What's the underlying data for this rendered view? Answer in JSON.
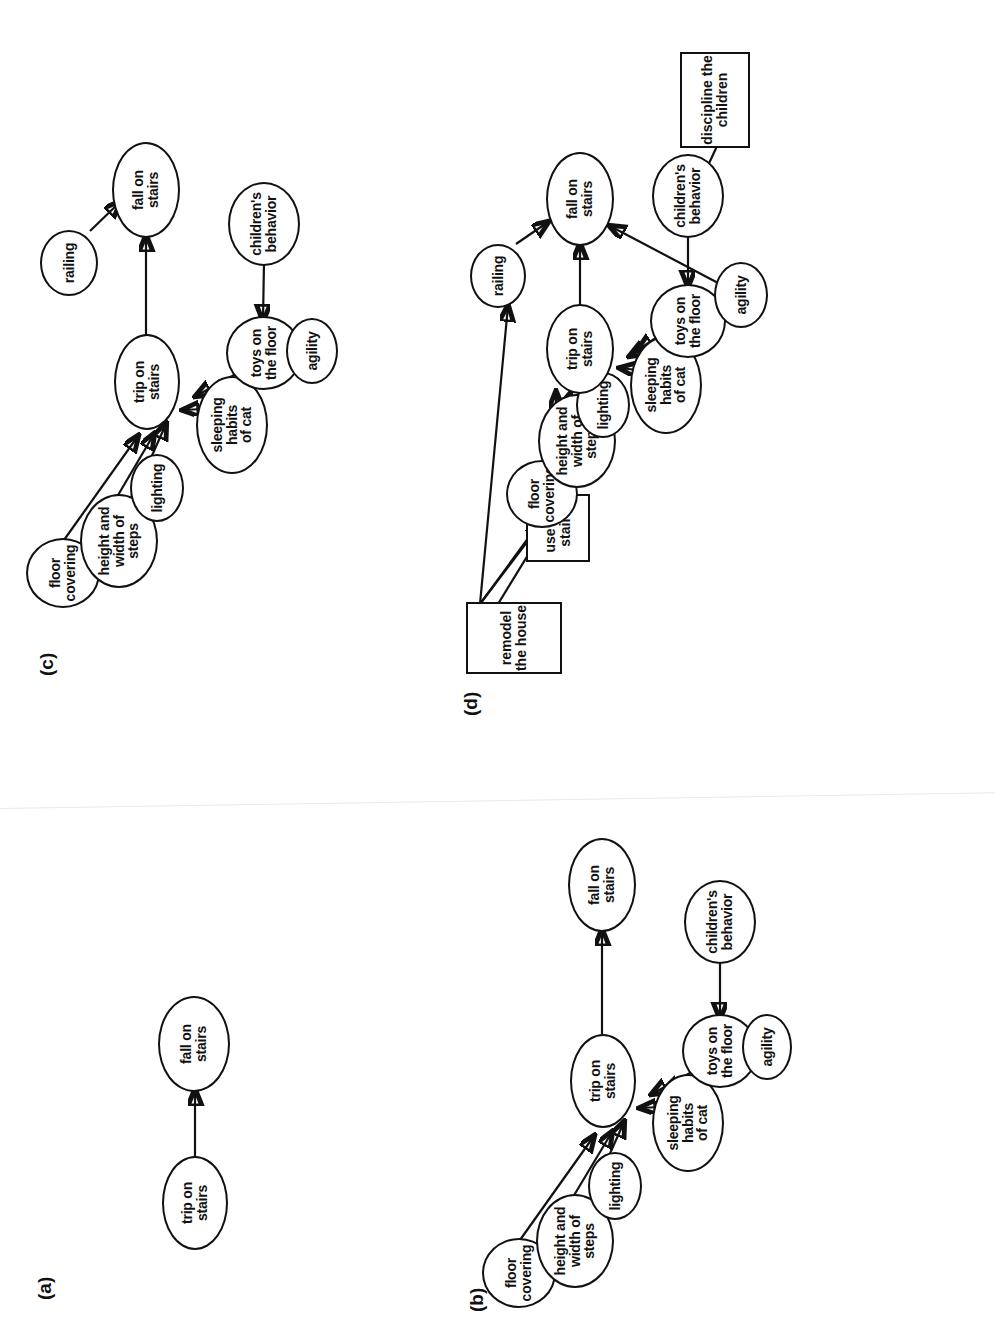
{
  "figure": {
    "orientation": "rotated-90-ccw",
    "background": "#ffffff",
    "ink": "#111111"
  },
  "panels": [
    {
      "id": "a",
      "label": "(a)",
      "nodes": [
        {
          "id": "trip",
          "label": "trip on\nstairs",
          "shape": "ellipse"
        },
        {
          "id": "fall",
          "label": "fall on\nstairs",
          "shape": "ellipse"
        }
      ],
      "edges": [
        {
          "from": "trip",
          "to": "fall"
        }
      ]
    },
    {
      "id": "b",
      "label": "(b)",
      "nodes": [
        {
          "id": "floor",
          "label": "floor\ncovering",
          "shape": "ellipse"
        },
        {
          "id": "height",
          "label": "height and\nwidth of steps",
          "shape": "ellipse"
        },
        {
          "id": "lighting",
          "label": "lighting",
          "shape": "ellipse"
        },
        {
          "id": "cat",
          "label": "sleeping habits\nof cat",
          "shape": "ellipse"
        },
        {
          "id": "toys",
          "label": "toys on\nthe floor",
          "shape": "ellipse"
        },
        {
          "id": "agility",
          "label": "agility",
          "shape": "ellipse"
        },
        {
          "id": "children",
          "label": "children's\nbehavior",
          "shape": "ellipse"
        },
        {
          "id": "trip",
          "label": "trip on\nstairs",
          "shape": "ellipse"
        },
        {
          "id": "fall",
          "label": "fall on\nstairs",
          "shape": "ellipse"
        }
      ],
      "edges": [
        {
          "from": "floor",
          "to": "trip"
        },
        {
          "from": "height",
          "to": "trip"
        },
        {
          "from": "lighting",
          "to": "trip"
        },
        {
          "from": "cat",
          "to": "trip"
        },
        {
          "from": "toys",
          "to": "trip"
        },
        {
          "from": "agility",
          "to": "trip"
        },
        {
          "from": "children",
          "to": "toys"
        },
        {
          "from": "trip",
          "to": "fall"
        }
      ]
    },
    {
      "id": "c",
      "label": "(c)",
      "nodes": [
        {
          "id": "floor",
          "label": "floor\ncovering",
          "shape": "ellipse"
        },
        {
          "id": "height",
          "label": "height and\nwidth of steps",
          "shape": "ellipse"
        },
        {
          "id": "lighting",
          "label": "lighting",
          "shape": "ellipse"
        },
        {
          "id": "cat",
          "label": "sleeping habits\nof cat",
          "shape": "ellipse"
        },
        {
          "id": "toys",
          "label": "toys on\nthe floor",
          "shape": "ellipse"
        },
        {
          "id": "agility",
          "label": "agility",
          "shape": "ellipse"
        },
        {
          "id": "children",
          "label": "children's\nbehavior",
          "shape": "ellipse"
        },
        {
          "id": "railing",
          "label": "railing",
          "shape": "ellipse"
        },
        {
          "id": "trip",
          "label": "trip on\nstairs",
          "shape": "ellipse"
        },
        {
          "id": "fall",
          "label": "fall on\nstairs",
          "shape": "ellipse"
        }
      ],
      "edges": [
        {
          "from": "floor",
          "to": "trip"
        },
        {
          "from": "height",
          "to": "trip"
        },
        {
          "from": "lighting",
          "to": "trip"
        },
        {
          "from": "cat",
          "to": "trip"
        },
        {
          "from": "toys",
          "to": "trip"
        },
        {
          "from": "agility",
          "to": "trip"
        },
        {
          "from": "children",
          "to": "toys"
        },
        {
          "from": "trip",
          "to": "fall"
        },
        {
          "from": "railing",
          "to": "fall"
        }
      ]
    },
    {
      "id": "d",
      "label": "(d)",
      "nodes": [
        {
          "id": "floor",
          "label": "floor\ncovering",
          "shape": "ellipse"
        },
        {
          "id": "height",
          "label": "height and\nwidth of steps",
          "shape": "ellipse"
        },
        {
          "id": "lighting",
          "label": "lighting",
          "shape": "ellipse"
        },
        {
          "id": "cat",
          "label": "sleeping habits\nof cat",
          "shape": "ellipse"
        },
        {
          "id": "toys",
          "label": "toys on\nthe floor",
          "shape": "ellipse"
        },
        {
          "id": "agility",
          "label": "agility",
          "shape": "ellipse"
        },
        {
          "id": "children",
          "label": "children's\nbehavior",
          "shape": "ellipse"
        },
        {
          "id": "railing",
          "label": "railing",
          "shape": "ellipse"
        },
        {
          "id": "trip",
          "label": "trip on\nstairs",
          "shape": "ellipse"
        },
        {
          "id": "fall",
          "label": "fall on\nstairs",
          "shape": "ellipse"
        },
        {
          "id": "remodel",
          "label": "remodel\nthe house",
          "shape": "rect"
        },
        {
          "id": "usestairs",
          "label": "use the\nstairs",
          "shape": "rect"
        },
        {
          "id": "discipline",
          "label": "discipline the\nchildren",
          "shape": "rect"
        }
      ],
      "edges": [
        {
          "from": "floor",
          "to": "trip"
        },
        {
          "from": "height",
          "to": "trip"
        },
        {
          "from": "lighting",
          "to": "trip"
        },
        {
          "from": "cat",
          "to": "trip"
        },
        {
          "from": "toys",
          "to": "trip"
        },
        {
          "from": "agility",
          "to": "trip"
        },
        {
          "from": "agility",
          "to": "fall"
        },
        {
          "from": "children",
          "to": "toys"
        },
        {
          "from": "trip",
          "to": "fall"
        },
        {
          "from": "railing",
          "to": "fall"
        },
        {
          "from": "remodel",
          "to": "floor"
        },
        {
          "from": "remodel",
          "to": "height"
        },
        {
          "from": "remodel",
          "to": "lighting"
        },
        {
          "from": "remodel",
          "to": "railing"
        },
        {
          "from": "usestairs",
          "to": "trip"
        },
        {
          "from": "discipline",
          "to": "children"
        }
      ]
    }
  ],
  "labels": {
    "a": "(a)",
    "b": "(b)",
    "c": "(c)",
    "d": "(d)"
  },
  "node_text": {
    "trip_on_stairs": "trip on stairs",
    "fall_on_stairs": "fall on stairs",
    "floor_covering": "floor covering",
    "height_width": "height and width of steps",
    "lighting": "lighting",
    "sleeping_habits": "sleeping habits of cat",
    "toys_on_floor": "toys on the floor",
    "agility": "agility",
    "childrens_behavior": "children's behavior",
    "railing": "railing",
    "remodel_house": "remodel the house",
    "use_the_stairs": "use the stairs",
    "discipline_children": "discipline the children"
  }
}
